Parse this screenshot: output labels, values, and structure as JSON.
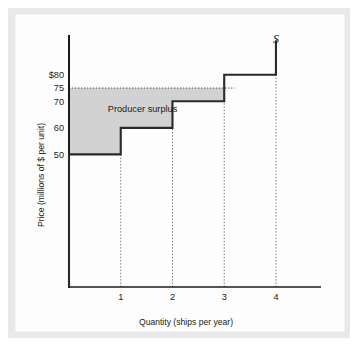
{
  "figure": {
    "background_color": "#e9e9e9",
    "plate_color": "#fdfdfd",
    "axis_color": "#1b1b1b",
    "curve_color": "#2a2a2a",
    "surplus_fill_color": "#d2d2d2",
    "dotted_line_color": "#555555"
  },
  "chart_data": {
    "type": "line",
    "title": "",
    "subtitle": "",
    "xlabel": "Quantity (ships per year)",
    "ylabel": "Price (millions of $ per unit)",
    "xlim": [
      0,
      4.6
    ],
    "ylim": [
      0,
      95
    ],
    "grid": false,
    "legend_position": "none",
    "x_ticks": [
      1,
      2,
      3,
      4
    ],
    "x_tick_labels": [
      "1",
      "2",
      "3",
      "4"
    ],
    "y_ticks": [
      50,
      60,
      70,
      75,
      80
    ],
    "y_tick_labels": [
      "50",
      "60",
      "70",
      "75",
      "$80"
    ],
    "series": [
      {
        "name": "S",
        "label": "S",
        "style": "step",
        "steps": [
          {
            "quantity_from": 0,
            "quantity_to": 1,
            "price": 50
          },
          {
            "quantity_from": 1,
            "quantity_to": 2,
            "price": 60
          },
          {
            "quantity_from": 2,
            "quantity_to": 3,
            "price": 70
          },
          {
            "quantity_from": 3,
            "quantity_to": 4,
            "price": 80
          }
        ],
        "vertical_top_price": 93
      }
    ],
    "market_price": 75,
    "annotations": [
      {
        "name": "producer-surplus",
        "text": "Producer surplus",
        "x": 0.75,
        "y": 67
      },
      {
        "name": "supply-curve",
        "text": "S",
        "x": 4.0,
        "y": 92
      }
    ],
    "shaded_regions": [
      {
        "name": "producer-surplus-area",
        "label": "Producer surplus",
        "price_ceiling": 75,
        "segments": [
          {
            "quantity_from": 0,
            "quantity_to": 1,
            "price_floor": 50
          },
          {
            "quantity_from": 1,
            "quantity_to": 2,
            "price_floor": 60
          },
          {
            "quantity_from": 2,
            "quantity_to": 3,
            "price_floor": 70
          }
        ]
      }
    ],
    "dotted_guides": {
      "horizontal": [
        {
          "price": 75,
          "from_quantity": 0,
          "to_quantity": 3.2
        }
      ],
      "vertical": [
        {
          "quantity": 1,
          "from_price": 0,
          "to_price": 60
        },
        {
          "quantity": 2,
          "from_price": 0,
          "to_price": 70
        },
        {
          "quantity": 3,
          "from_price": 0,
          "to_price": 80
        },
        {
          "quantity": 4,
          "from_price": 0,
          "to_price": 80
        }
      ]
    }
  }
}
